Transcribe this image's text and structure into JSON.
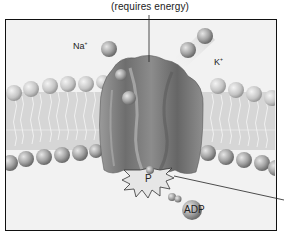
{
  "figure": {
    "top_label": "(requires energy)",
    "ions": {
      "sodium": {
        "symbol": "Na",
        "charge": "+"
      },
      "potassium": {
        "symbol": "K",
        "charge": "+"
      }
    },
    "phosphate_label": "P",
    "adp_label": "ADP"
  },
  "colors": {
    "frame_border": "#111111",
    "background": "#f2f2f2",
    "protein": "#7a7a7a",
    "sphere": "#a8a8a8"
  }
}
